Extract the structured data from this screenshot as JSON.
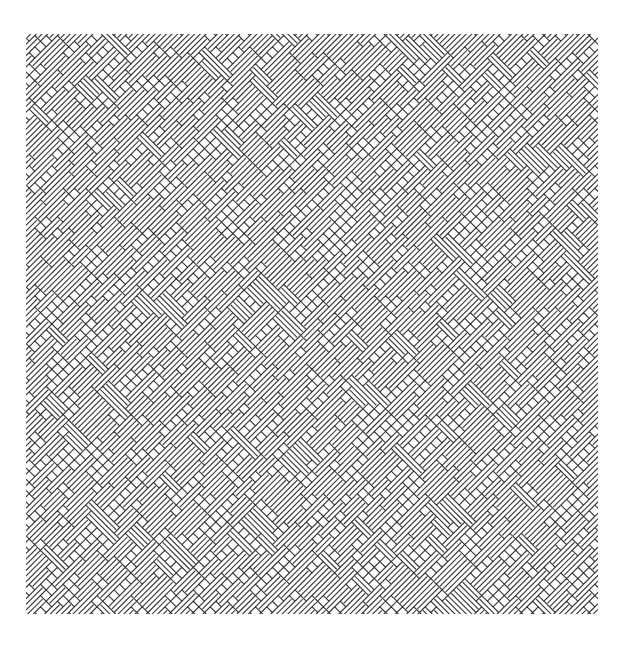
{
  "artwork": {
    "type": "line-art basket-weave pattern",
    "background": "#ffffff",
    "stroke_color": "#333333",
    "stroke_width": 1.1,
    "region": {
      "x": 26,
      "y": 34,
      "width": 572,
      "height": 580
    },
    "angle_deg": 45,
    "cell_size": 8,
    "brick_lengths": [
      3,
      4,
      5
    ],
    "seed": 7
  }
}
